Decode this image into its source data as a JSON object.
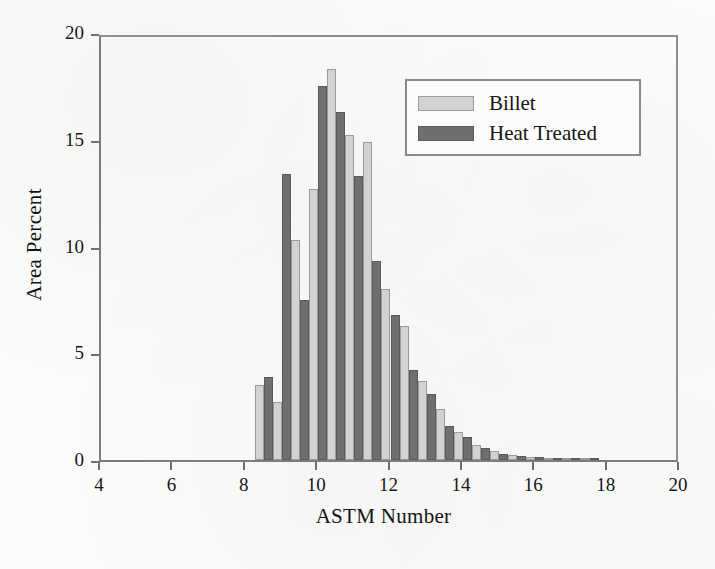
{
  "chart_data": {
    "type": "bar",
    "title": "",
    "xlabel": "ASTM Number",
    "ylabel": "Area Percent",
    "xlim": [
      4,
      20
    ],
    "ylim": [
      0,
      20
    ],
    "xticks": [
      4,
      6,
      8,
      10,
      12,
      14,
      16,
      18,
      20
    ],
    "yticks": [
      0,
      5,
      10,
      15,
      20
    ],
    "grid": false,
    "legend_position": "top-right",
    "bar_width_astm": 0.25,
    "categories": [
      8.5,
      9.0,
      9.5,
      10.0,
      10.5,
      11.0,
      11.5,
      12.0,
      12.5,
      13.0,
      13.5,
      14.0,
      14.5,
      15.0,
      15.5,
      16.0,
      16.5,
      17.0,
      17.5
    ],
    "series": [
      {
        "name": "Billet",
        "color": "#d2d2d2",
        "values": [
          3.5,
          2.7,
          10.3,
          12.7,
          18.3,
          15.2,
          14.9,
          8.0,
          6.3,
          3.7,
          2.4,
          1.3,
          0.7,
          0.4,
          0.25,
          0.15,
          0.1,
          0.05,
          0.03
        ]
      },
      {
        "name": "Heat Treated",
        "color": "#6f6f6f",
        "values": [
          3.9,
          13.4,
          7.5,
          17.5,
          16.3,
          13.3,
          9.3,
          6.8,
          4.2,
          3.1,
          1.6,
          1.1,
          0.55,
          0.3,
          0.2,
          0.12,
          0.08,
          0.04,
          0.02
        ]
      }
    ]
  },
  "legend": {
    "items": [
      {
        "label": "Billet",
        "swatch": "light-gray-swatch"
      },
      {
        "label": "Heat Treated",
        "swatch": "dark-gray-swatch"
      }
    ]
  },
  "axes": {
    "x_title": "ASTM Number",
    "y_title": "Area Percent",
    "x_tick_labels": [
      "4",
      "6",
      "8",
      "10",
      "12",
      "14",
      "16",
      "18",
      "20"
    ],
    "y_tick_labels": [
      "0",
      "5",
      "10",
      "15",
      "20"
    ]
  }
}
